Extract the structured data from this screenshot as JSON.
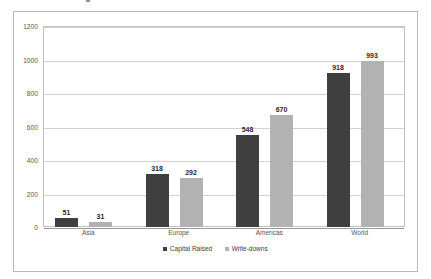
{
  "chart_data": {
    "type": "bar",
    "title": "",
    "subtitle": "",
    "xlabel": "",
    "ylabel": "",
    "categories": [
      "Asia",
      "Europe",
      "Americas",
      "World"
    ],
    "series": [
      {
        "name": "Capital Raised",
        "color": "#3f3f3f",
        "values": [
          51,
          318,
          548,
          918
        ]
      },
      {
        "name": "Write-downs",
        "color": "#b2b2b2",
        "values": [
          31,
          292,
          670,
          993
        ]
      }
    ],
    "ylim": [
      0,
      1200
    ],
    "ytick_step": 200,
    "yticks": [
      0,
      200,
      400,
      600,
      800,
      1000,
      1200
    ],
    "ytick_labels": [
      "0",
      "200",
      "400",
      "600",
      "800",
      "1000",
      "1200"
    ],
    "grid": "horizontal",
    "data_labels": true,
    "legend_position": "bottom-center",
    "plot_background": "#ffffff",
    "gridline_color": "#d2d2d2",
    "border_color": "#b9b9b9"
  }
}
